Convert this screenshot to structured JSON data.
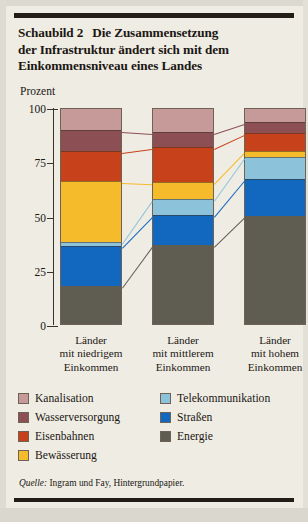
{
  "figure": {
    "label": "Schaubild 2",
    "title_line1": "Die Zusammensetzung",
    "title_line2": "der Infrastruktur ändert sich mit dem",
    "title_line3": "Einkommensniveau eines Landes",
    "source_prefix": "Quelle:",
    "source_text": " Ingram und Fay, Hintergrundpapier."
  },
  "chart_data": {
    "type": "bar",
    "stacked": true,
    "normalized": true,
    "xlabel": "",
    "ylabel": "Prozent",
    "ylim": [
      0,
      100
    ],
    "yticks": [
      0,
      25,
      50,
      75,
      100
    ],
    "ytick_labels": [
      "0",
      "25",
      "50",
      "75",
      "100"
    ],
    "grid": false,
    "legend_position": "below-plot",
    "categories": [
      "Länder mit niedrigem Einkommen",
      "Länder mit mittlerem Einkommen",
      "Länder mit hohem Einkommen"
    ],
    "category_lines": [
      [
        "Länder",
        "mit niedrigem",
        "Einkommen"
      ],
      [
        "Länder",
        "mit mittlerem",
        "Einkommen"
      ],
      [
        "Länder",
        "mit hohem",
        "Einkommen"
      ]
    ],
    "series": [
      {
        "name": "Energie",
        "color": "#5f5c52",
        "values": [
          17.5,
          36.4,
          49.8
        ]
      },
      {
        "name": "Straßen",
        "color": "#1268bf",
        "values": [
          18.5,
          13.8,
          17.0
        ]
      },
      {
        "name": "Telekommunikation",
        "color": "#8cc3da",
        "values": [
          1.8,
          7.4,
          10.2
        ]
      },
      {
        "name": "Bewässerung",
        "color": "#f5bb2a",
        "values": [
          28.2,
          7.8,
          2.7
        ]
      },
      {
        "name": "Eisenbahnen",
        "color": "#c7411a",
        "values": [
          13.7,
          16.2,
          8.3
        ]
      },
      {
        "name": "Wasserversorgung",
        "color": "#8c5054",
        "values": [
          9.7,
          6.9,
          5.0
        ]
      },
      {
        "name": "Kanalisation",
        "color": "#c59a98",
        "values": [
          10.6,
          11.5,
          7.0
        ]
      }
    ],
    "series_order_bottom_to_top": [
      "Energie",
      "Straßen",
      "Telekommunikation",
      "Bewässerung",
      "Eisenbahnen",
      "Wasserversorgung",
      "Kanalisation"
    ],
    "cumulative_boundaries": {
      "Länder mit niedrigem Einkommen": [
        0,
        17.5,
        36.0,
        37.8,
        66.0,
        79.7,
        89.4,
        100
      ],
      "Länder mit mittlerem Einkommen": [
        0,
        36.4,
        50.2,
        57.6,
        65.4,
        81.6,
        88.5,
        100
      ],
      "Länder mit hohem Einkommen": [
        0,
        49.8,
        66.8,
        77.0,
        79.7,
        88.0,
        93.0,
        100
      ]
    }
  },
  "legend": {
    "left_column": [
      {
        "label": "Kanalisation",
        "color": "#c59a98"
      },
      {
        "label": "Wasserversorgung",
        "color": "#8c5054"
      },
      {
        "label": "Eisenbahnen",
        "color": "#c7411a"
      },
      {
        "label": "Bewässerung",
        "color": "#f5bb2a"
      }
    ],
    "right_column": [
      {
        "label": "Telekommunikation",
        "color": "#8cc3da"
      },
      {
        "label": "Straßen",
        "color": "#1268bf"
      },
      {
        "label": "Energie",
        "color": "#5f5c52"
      }
    ]
  }
}
